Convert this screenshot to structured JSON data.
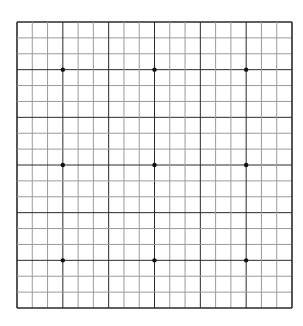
{
  "board": {
    "size": 19,
    "left": 17,
    "top": 22,
    "right": 292,
    "bottom": 308,
    "line_color": "#2a2a2a",
    "light_line_color": "#9a9a9a",
    "background": "#ffffff",
    "star_points": [
      [
        3,
        3
      ],
      [
        9,
        3
      ],
      [
        15,
        3
      ],
      [
        3,
        9
      ],
      [
        9,
        9
      ],
      [
        15,
        9
      ],
      [
        3,
        15
      ],
      [
        9,
        15
      ],
      [
        15,
        15
      ]
    ],
    "star_color": "#111111"
  }
}
